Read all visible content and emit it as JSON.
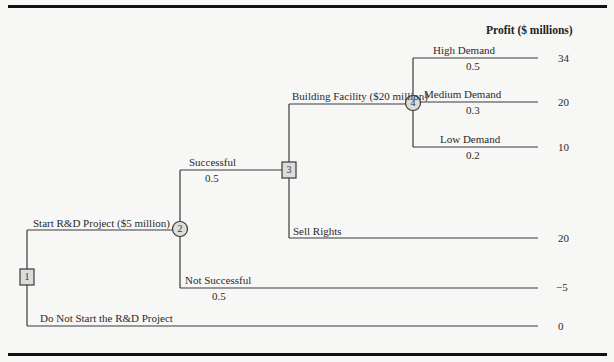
{
  "header": {
    "profit_label": "Profit ($ millions)"
  },
  "nodes": {
    "n1": {
      "label": "1",
      "type": "decision"
    },
    "n2": {
      "label": "2",
      "type": "chance"
    },
    "n3": {
      "label": "3",
      "type": "decision"
    },
    "n4": {
      "label": "4",
      "type": "chance"
    }
  },
  "branches": {
    "start_rd": {
      "label": "Start R&D Project ($5 million)"
    },
    "do_not_start": {
      "label": "Do Not Start the R&D Project",
      "payoff": "0"
    },
    "successful": {
      "label": "Successful",
      "prob": "0.5"
    },
    "not_successful": {
      "label": "Not Successful",
      "prob": "0.5",
      "payoff": "−5"
    },
    "building": {
      "label": "Building Facility ($20 million)"
    },
    "sell_rights": {
      "label": "Sell Rights",
      "payoff": "20"
    },
    "high": {
      "label": "High Demand",
      "prob": "0.5",
      "payoff": "34"
    },
    "medium": {
      "label": "Medium Demand",
      "prob": "0.3",
      "payoff": "20"
    },
    "low": {
      "label": "Low Demand",
      "prob": "0.2",
      "payoff": "10"
    }
  },
  "colors": {
    "line": "#3a3a3a",
    "node_fill": "#dcdcdc",
    "rule": "#111111",
    "background": "#f7f7f6"
  }
}
